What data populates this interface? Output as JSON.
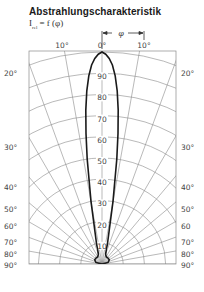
{
  "header": {
    "title": "Abstrahlungscharakteristik",
    "formula_main": "I",
    "formula_sub": "rel",
    "formula_rest": " = f (φ)",
    "phi_symbol": "φ"
  },
  "chart_data": {
    "type": "polar",
    "title": "Abstrahlungscharakteristik",
    "subtitle": "I_rel = f(φ)",
    "angle_label": "φ",
    "angle_unit": "°",
    "angle_ticks_top": [
      "10°",
      "0°",
      "10°"
    ],
    "angle_ticks_left": [
      "20°",
      "30°",
      "40°",
      "50°",
      "60°",
      "70°",
      "80°",
      "90°"
    ],
    "angle_ticks_right": [
      "20°",
      "30°",
      "40°",
      "50°",
      "60",
      "70°",
      "80°",
      "90°"
    ],
    "radial_ticks": [
      "90",
      "80",
      "70",
      "60",
      "50",
      "40",
      "30",
      "20",
      "10"
    ],
    "radial_range": [
      0,
      100
    ],
    "angle_range": [
      -90,
      90
    ],
    "grid": true,
    "series": [
      {
        "name": "I_rel",
        "angle_deg": [
          0,
          1,
          2,
          3,
          4,
          5,
          6,
          7,
          8,
          10,
          15,
          20,
          30,
          45,
          60,
          75,
          90
        ],
        "values": [
          100,
          99,
          97,
          94,
          89,
          82,
          73,
          62,
          50,
          30,
          10,
          5,
          4,
          4,
          4,
          3,
          0
        ]
      }
    ]
  }
}
